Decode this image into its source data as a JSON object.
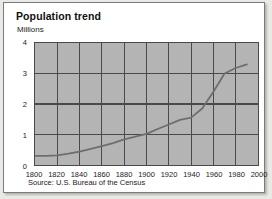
{
  "chart_data": {
    "type": "line",
    "title": "Population trend",
    "ylabel": "Millions",
    "xlabel": "",
    "source": "Source: U.S. Bureau of the Census",
    "grid": true,
    "legend": "none",
    "xlim": [
      1800,
      2000
    ],
    "ylim": [
      0,
      4
    ],
    "xticks": [
      "1800",
      "1820",
      "1840",
      "1860",
      "1880",
      "1900",
      "1920",
      "1940",
      "1960",
      "1980",
      "2000"
    ],
    "yticks": [
      "0",
      "1",
      "2",
      "3",
      "4"
    ],
    "plot_bg_color": "#b4b4b4",
    "grid_color": "#4a4a4a",
    "line_color": "#6e6e6e",
    "x": [
      1800,
      1810,
      1820,
      1830,
      1840,
      1850,
      1860,
      1870,
      1880,
      1890,
      1900,
      1910,
      1920,
      1930,
      1940,
      1950,
      1960,
      1970,
      1980,
      1990
    ],
    "values": [
      0.3,
      0.3,
      0.32,
      0.37,
      0.44,
      0.53,
      0.62,
      0.72,
      0.84,
      0.93,
      1.02,
      1.18,
      1.33,
      1.48,
      1.55,
      1.85,
      2.4,
      3.0,
      3.18,
      3.3
    ],
    "series": [
      {
        "name": "Population",
        "values": [
          0.3,
          0.3,
          0.32,
          0.37,
          0.44,
          0.53,
          0.62,
          0.72,
          0.84,
          0.93,
          1.02,
          1.18,
          1.33,
          1.48,
          1.55,
          1.85,
          2.4,
          3.0,
          3.18,
          3.3
        ]
      }
    ]
  }
}
